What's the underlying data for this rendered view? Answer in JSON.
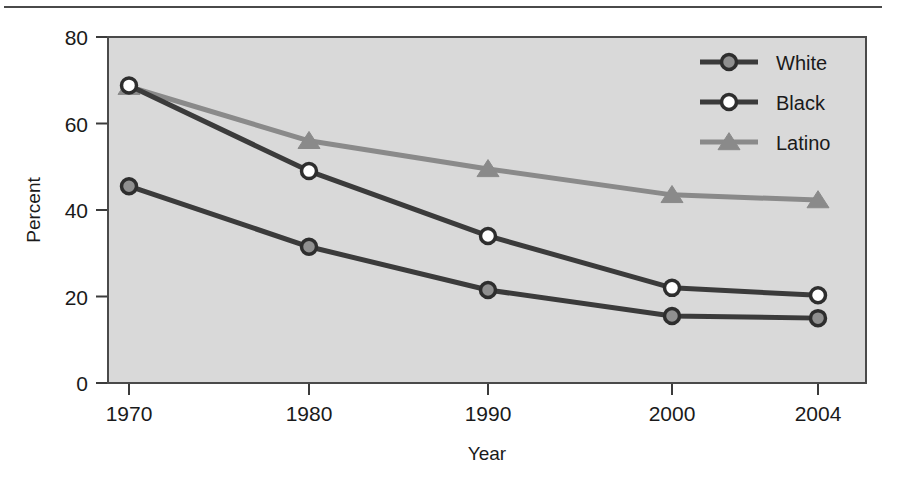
{
  "figure": {
    "top_rule": true,
    "plot_background": "#d9d9d9",
    "plot_border_color": "#4a4a4a"
  },
  "axes": {
    "y_title": "Percent",
    "x_title": "Year",
    "y_ticks": [
      "0",
      "20",
      "40",
      "60",
      "80"
    ],
    "x_ticks": [
      "1970",
      "1980",
      "1990",
      "2000",
      "2004"
    ]
  },
  "legend": {
    "entries": [
      {
        "label": "White",
        "marker": "filled-circle-icon",
        "color": "#3b3b3b",
        "marker_fill": "#8f8f8f"
      },
      {
        "label": "Black",
        "marker": "open-circle-icon",
        "color": "#3b3b3b",
        "marker_fill": "#ffffff"
      },
      {
        "label": "Latino",
        "marker": "triangle-icon",
        "color": "#8a8a8a",
        "marker_fill": "#8a8a8a"
      }
    ]
  },
  "chart_data": {
    "type": "line",
    "title": "",
    "xlabel": "Year",
    "ylabel": "Percent",
    "categories": [
      "1970",
      "1980",
      "1990",
      "2000",
      "2004"
    ],
    "x": [
      1970,
      1980,
      1990,
      2000,
      2004
    ],
    "ylim": [
      0,
      80
    ],
    "yticks": [
      0,
      20,
      40,
      60,
      80
    ],
    "grid": false,
    "legend_position": "top-right",
    "series": [
      {
        "name": "White",
        "color": "#3b3b3b",
        "marker": "filled-circle",
        "values": [
          45.5,
          31.5,
          21.5,
          15.5,
          15.0
        ]
      },
      {
        "name": "Black",
        "color": "#3b3b3b",
        "marker": "open-circle",
        "values": [
          68.8,
          49.0,
          34.0,
          22.0,
          20.3
        ]
      },
      {
        "name": "Latino",
        "color": "#8a8a8a",
        "marker": "triangle",
        "values": [
          68.5,
          56.0,
          49.5,
          43.5,
          42.3
        ]
      }
    ]
  }
}
